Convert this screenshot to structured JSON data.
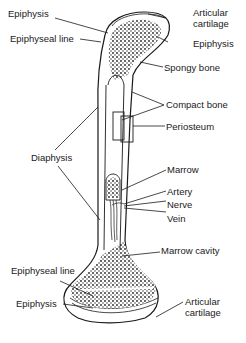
{
  "diagram": {
    "type": "anatomy",
    "labels": {
      "epiphysis_top_left": "Epiphysis",
      "epiphyseal_line_top": "Epiphyseal line",
      "articular_cartilage_top": "Articular\ncartilage",
      "epiphysis_top_right": "Epiphysis",
      "spongy_bone": "Spongy bone",
      "compact_bone": "Compact bone",
      "periosteum": "Periosteum",
      "diaphysis": "Diaphysis",
      "marrow": "Marrow",
      "artery": "Artery",
      "nerve": "Nerve",
      "vein": "Vein",
      "marrow_cavity": "Marrow cavity",
      "epiphyseal_line_bottom": "Epiphyseal line",
      "epiphysis_bottom": "Epiphysis",
      "articular_cartilage_bottom": "Articular\ncartilage"
    },
    "colors": {
      "ink": "#1a1a1a",
      "background": "#ffffff"
    }
  }
}
